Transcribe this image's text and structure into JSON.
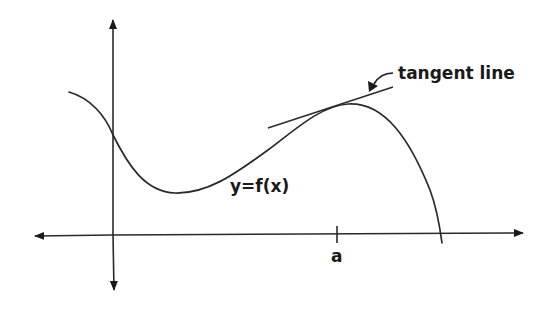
{
  "diagram": {
    "title": "",
    "labels": {
      "curve": "y=f(x)",
      "tangent": "tangent line",
      "point": "a"
    },
    "colors": {
      "background": "#ffffff",
      "stroke": "#2a2a2a",
      "text": "#1a1a1a"
    },
    "axes": {
      "x_axis": {
        "y": 235,
        "x_start": 33,
        "x_end": 525,
        "arrows": "both"
      },
      "y_axis": {
        "x": 113,
        "y_start": 18,
        "y_end": 292,
        "arrows": "both"
      }
    },
    "tick": {
      "x": 337,
      "label": "a"
    },
    "curve": {
      "path": "M69,92 C90,98 105,115 113,135 C128,165 145,192 175,193 C210,194 240,170 268,150 C295,130 320,106 348,104 C385,102 410,140 430,190 C436,206 440,228 442,243",
      "description": "smooth function with local minimum left of center, local maximum near x=a, crossing x-axis on the right"
    },
    "tangent_line": {
      "x1": 268,
      "y1": 128,
      "x2": 393,
      "y2": 87
    }
  }
}
